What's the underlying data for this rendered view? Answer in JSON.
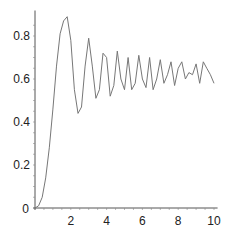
{
  "chart_data": {
    "type": "line",
    "title": "",
    "xlabel": "",
    "ylabel": "",
    "xlim": [
      0,
      10.2
    ],
    "ylim": [
      0,
      0.9
    ],
    "grid": false,
    "legend": null,
    "x_ticks": [
      "2",
      "4",
      "6",
      "8",
      "10"
    ],
    "y_ticks": [
      "0",
      "0.2",
      "0.4",
      "0.6",
      "0.8"
    ],
    "origin_label": "0",
    "line_color": "#777777",
    "axis_color": "#555555",
    "series": [
      {
        "name": "response",
        "x": [
          0,
          0.2,
          0.4,
          0.6,
          0.8,
          1.0,
          1.2,
          1.4,
          1.6,
          1.8,
          2.0,
          2.2,
          2.4,
          2.6,
          2.8,
          3.0,
          3.2,
          3.4,
          3.6,
          3.8,
          4.0,
          4.2,
          4.4,
          4.6,
          4.8,
          5.0,
          5.2,
          5.4,
          5.6,
          5.8,
          6.0,
          6.2,
          6.4,
          6.6,
          6.8,
          7.0,
          7.2,
          7.4,
          7.6,
          7.8,
          8.0,
          8.2,
          8.4,
          8.6,
          8.8,
          9.0,
          9.2,
          9.4,
          9.6,
          9.8,
          10.0
        ],
        "y": [
          0.0,
          0.01,
          0.05,
          0.14,
          0.28,
          0.46,
          0.66,
          0.81,
          0.87,
          0.89,
          0.78,
          0.55,
          0.44,
          0.47,
          0.66,
          0.79,
          0.66,
          0.51,
          0.55,
          0.72,
          0.7,
          0.52,
          0.57,
          0.73,
          0.6,
          0.55,
          0.7,
          0.55,
          0.58,
          0.71,
          0.6,
          0.56,
          0.7,
          0.55,
          0.6,
          0.69,
          0.58,
          0.62,
          0.68,
          0.57,
          0.65,
          0.68,
          0.6,
          0.63,
          0.62,
          0.67,
          0.58,
          0.68,
          0.65,
          0.62,
          0.58
        ]
      }
    ]
  }
}
